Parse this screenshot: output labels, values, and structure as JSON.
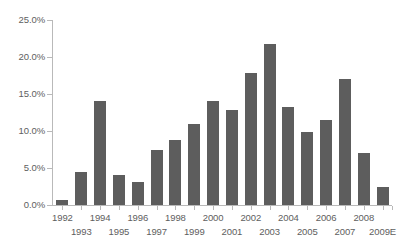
{
  "chart_data": {
    "type": "bar",
    "title": "",
    "subtitle": "",
    "xlabel": "",
    "ylabel": "",
    "ylim": [
      0,
      25
    ],
    "yticks": [
      0,
      5,
      10,
      15,
      20,
      25
    ],
    "ytick_labels": [
      "0.0%",
      "5.0%",
      "10.0%",
      "15.0%",
      "20.0%",
      "25.0%"
    ],
    "grid": false,
    "legend": "none",
    "bar_color": "#5d5d5d",
    "axis_color": "#b9b9b9",
    "text_color": "#5e5e5e",
    "background": "#ffffff",
    "categories": [
      "1992",
      "1993",
      "1994",
      "1995",
      "1996",
      "1997",
      "1998",
      "1999",
      "2000",
      "2001",
      "2002",
      "2003",
      "2004",
      "2005",
      "2006",
      "2007",
      "2008",
      "2009E"
    ],
    "values": [
      0.7,
      4.4,
      14.1,
      4.1,
      3.1,
      7.4,
      8.8,
      11.0,
      14.0,
      12.8,
      17.8,
      21.8,
      13.3,
      9.9,
      11.5,
      17.0,
      7.0,
      2.4
    ],
    "value_labels": [
      "0.7%",
      "4.4%",
      "14.1%",
      "4.1%",
      "3.1%",
      "7.4%",
      "8.8%",
      "11.0%",
      "14.0%",
      "12.8%",
      "17.8%",
      "21.8%",
      "13.3%",
      "9.9%",
      "11.5%",
      "17.0%",
      "7.0%",
      "2.4%"
    ]
  }
}
